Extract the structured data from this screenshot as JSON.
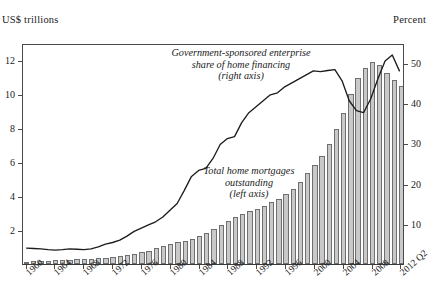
{
  "axis_captions": {
    "left": "US$ trillions",
    "right": "Percent"
  },
  "annotations": {
    "gse": "Government-sponsored enterprise share of home financing (right axis)",
    "gse_l1": "Government-sponsored enterprise",
    "gse_l2": "share of home financing",
    "gse_l3": "(right axis)",
    "mortgages_l1": "Total home mortgages",
    "mortgages_l2": "outstanding",
    "mortgages_l3": "(left axis)"
  },
  "chart_data": {
    "type": "bar",
    "title": "",
    "subtitle": "",
    "xlabel": "",
    "ylabel": "US$ trillions",
    "y2label": "Percent",
    "ylim": [
      0,
      13
    ],
    "y2lim": [
      0,
      55
    ],
    "yticks": [
      2,
      4,
      6,
      8,
      10,
      12
    ],
    "y2ticks": [
      10,
      20,
      30,
      40,
      50
    ],
    "xticks": [
      "1960",
      "1964",
      "1968",
      "1972",
      "1976",
      "1980",
      "1984",
      "1988",
      "1992",
      "1996",
      "2000",
      "2004",
      "2008",
      "2012 Q2"
    ],
    "grid": false,
    "legend": "annotations-inline",
    "x": [
      1960,
      1961,
      1962,
      1963,
      1964,
      1965,
      1966,
      1967,
      1968,
      1969,
      1970,
      1971,
      1972,
      1973,
      1974,
      1975,
      1976,
      1977,
      1978,
      1979,
      1980,
      1981,
      1982,
      1983,
      1984,
      1985,
      1986,
      1987,
      1988,
      1989,
      1990,
      1991,
      1992,
      1993,
      1994,
      1995,
      1996,
      1997,
      1998,
      1999,
      2000,
      2001,
      2002,
      2003,
      2004,
      2005,
      2006,
      2007,
      2008,
      2009,
      2010,
      2011,
      2012
    ],
    "series": [
      {
        "name": "Total home mortgages outstanding (left axis)",
        "axis": "left",
        "render": "bar",
        "unit": "US$ trillions",
        "values": [
          0.14,
          0.16,
          0.18,
          0.2,
          0.22,
          0.24,
          0.26,
          0.27,
          0.29,
          0.31,
          0.33,
          0.38,
          0.44,
          0.5,
          0.55,
          0.6,
          0.68,
          0.79,
          0.92,
          1.06,
          1.19,
          1.28,
          1.33,
          1.46,
          1.63,
          1.82,
          2.04,
          2.28,
          2.52,
          2.76,
          2.95,
          3.1,
          3.25,
          3.42,
          3.62,
          3.83,
          4.1,
          4.41,
          4.82,
          5.33,
          5.85,
          6.38,
          7.07,
          7.94,
          8.9,
          10.0,
          10.92,
          11.55,
          11.9,
          11.7,
          11.25,
          10.8,
          10.5
        ]
      },
      {
        "name": "Government-sponsored enterprise share of home financing (right axis)",
        "axis": "right",
        "render": "line",
        "unit": "percent",
        "values": [
          4.0,
          3.9,
          3.8,
          3.6,
          3.5,
          3.6,
          3.8,
          3.7,
          3.6,
          3.8,
          4.3,
          5.0,
          5.4,
          6.0,
          7.0,
          8.2,
          9.0,
          9.8,
          10.6,
          11.8,
          13.5,
          15.2,
          18.5,
          22.0,
          23.5,
          24.0,
          26.5,
          30.0,
          31.5,
          32.0,
          35.5,
          38.0,
          39.5,
          41.0,
          42.5,
          43.0,
          44.5,
          45.5,
          46.5,
          47.5,
          48.5,
          48.3,
          48.6,
          48.8,
          46.0,
          41.0,
          38.5,
          38.0,
          41.5,
          46.5,
          51.0,
          52.5,
          48.5
        ]
      }
    ]
  }
}
